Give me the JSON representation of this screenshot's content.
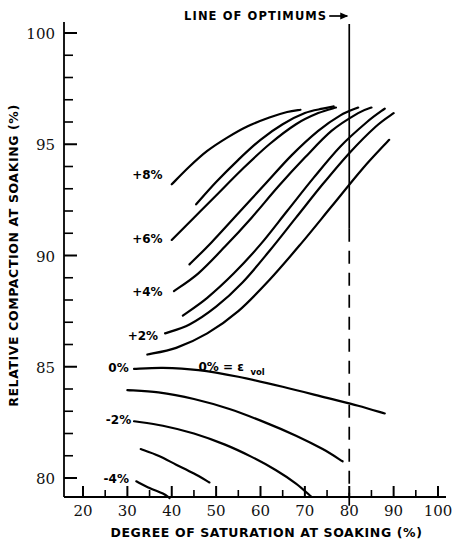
{
  "chart_data": {
    "type": "line",
    "title": "",
    "xlabel": "DEGREE OF SATURATION AT SOAKING (%)",
    "ylabel": "RELATIVE COMPACTION AT SOAKING (%)",
    "xlim": [
      18,
      102
    ],
    "ylim": [
      78.2,
      101
    ],
    "grid": false,
    "legend_position": "inline-curve-labels",
    "xticks": [
      20,
      30,
      40,
      50,
      60,
      70,
      80,
      90,
      100
    ],
    "xtick_labels": [
      "20",
      "30",
      "40",
      "50",
      "60",
      "70",
      "80",
      "90",
      "100"
    ],
    "x_minor_step": 5,
    "yticks": [
      80,
      85,
      90,
      95,
      100
    ],
    "ytick_labels": [
      "80",
      "85",
      "90",
      "95",
      "100"
    ],
    "y_minor_step": 1,
    "annotations": [
      {
        "name": "line-of-optimums",
        "text": "LINE OF OPTIMUMS",
        "x": 80,
        "arrow": "right"
      },
      {
        "name": "evol-definition",
        "text": "0% = ε",
        "subscript": "vol",
        "x": 46,
        "y": 84.9
      }
    ],
    "reference_line": {
      "name": "line-of-optimums",
      "x": 80,
      "style": "solid-then-dashed",
      "from_y": 78.6,
      "to_y": 101
    },
    "series": [
      {
        "name": "+8%",
        "label": "+8%",
        "label_x": 34.5,
        "label_y": 93.6,
        "points": [
          [
            40.0,
            93.2
          ],
          [
            44,
            94.0
          ],
          [
            48,
            94.7
          ],
          [
            52.5,
            95.3
          ],
          [
            57,
            95.8
          ],
          [
            62,
            96.2
          ],
          [
            66,
            96.45
          ],
          [
            69,
            96.55
          ]
        ]
      },
      {
        "name": "+7%",
        "label": "",
        "label_x": null,
        "label_y": null,
        "points": [
          [
            45.5,
            92.3
          ],
          [
            50,
            93.3
          ],
          [
            55,
            94.3
          ],
          [
            60,
            95.2
          ],
          [
            65,
            95.9
          ],
          [
            70,
            96.4
          ],
          [
            74,
            96.6
          ],
          [
            76.5,
            96.7
          ]
        ]
      },
      {
        "name": "+6%",
        "label": "+6%",
        "label_x": 34.5,
        "label_y": 90.75,
        "points": [
          [
            40.0,
            90.7
          ],
          [
            45,
            91.7
          ],
          [
            50,
            92.7
          ],
          [
            56,
            93.9
          ],
          [
            62,
            95.0
          ],
          [
            68,
            95.9
          ],
          [
            73,
            96.4
          ],
          [
            77,
            96.65
          ]
        ]
      },
      {
        "name": "+5%",
        "label": "",
        "label_x": null,
        "label_y": null,
        "points": [
          [
            44.0,
            89.6
          ],
          [
            49,
            90.6
          ],
          [
            55,
            91.9
          ],
          [
            61,
            93.2
          ],
          [
            67,
            94.5
          ],
          [
            73,
            95.6
          ],
          [
            78,
            96.3
          ],
          [
            82,
            96.65
          ]
        ]
      },
      {
        "name": "+4%",
        "label": "+4%",
        "label_x": 34.5,
        "label_y": 88.35,
        "points": [
          [
            40.5,
            88.4
          ],
          [
            46,
            89.2
          ],
          [
            52,
            90.4
          ],
          [
            58,
            91.7
          ],
          [
            64,
            93.1
          ],
          [
            70,
            94.4
          ],
          [
            76,
            95.6
          ],
          [
            82,
            96.4
          ],
          [
            85,
            96.65
          ]
        ]
      },
      {
        "name": "+3%",
        "label": "",
        "label_x": null,
        "label_y": null,
        "points": [
          [
            42.5,
            87.3
          ],
          [
            48,
            88.1
          ],
          [
            54,
            89.2
          ],
          [
            60,
            90.5
          ],
          [
            66,
            92.0
          ],
          [
            72,
            93.5
          ],
          [
            78,
            94.9
          ],
          [
            84,
            96.0
          ],
          [
            88,
            96.6
          ]
        ]
      },
      {
        "name": "+2%",
        "label": "+2%",
        "label_x": 33.5,
        "label_y": 86.4,
        "points": [
          [
            38.5,
            86.5
          ],
          [
            44,
            86.9
          ],
          [
            50,
            87.7
          ],
          [
            56,
            88.8
          ],
          [
            62,
            90.2
          ],
          [
            68,
            91.7
          ],
          [
            74,
            93.2
          ],
          [
            80,
            94.6
          ],
          [
            86,
            95.8
          ],
          [
            90,
            96.4
          ]
        ]
      },
      {
        "name": "+1%",
        "label": "",
        "label_x": null,
        "label_y": null,
        "points": [
          [
            34.5,
            85.55
          ],
          [
            41,
            85.85
          ],
          [
            48,
            86.5
          ],
          [
            55,
            87.5
          ],
          [
            62,
            88.9
          ],
          [
            69,
            90.5
          ],
          [
            76,
            92.2
          ],
          [
            83,
            93.9
          ],
          [
            89,
            95.2
          ]
        ]
      },
      {
        "name": "0%",
        "label": "0%",
        "label_x": 28.0,
        "label_y": 84.95,
        "points": [
          [
            31.5,
            84.9
          ],
          [
            38,
            84.95
          ],
          [
            46,
            84.85
          ],
          [
            55,
            84.55
          ],
          [
            65,
            84.1
          ],
          [
            75,
            83.6
          ],
          [
            82,
            83.25
          ],
          [
            88,
            82.9
          ]
        ]
      },
      {
        "name": "-1%",
        "label": "",
        "label_x": null,
        "label_y": null,
        "points": [
          [
            30.0,
            83.95
          ],
          [
            37,
            83.85
          ],
          [
            45,
            83.55
          ],
          [
            53,
            83.1
          ],
          [
            61,
            82.5
          ],
          [
            68,
            81.9
          ],
          [
            74,
            81.3
          ],
          [
            78.5,
            80.75
          ]
        ]
      },
      {
        "name": "-2%",
        "label": "-2%",
        "label_x": 28.0,
        "label_y": 82.6,
        "points": [
          [
            31.5,
            82.55
          ],
          [
            38,
            82.35
          ],
          [
            45,
            82.0
          ],
          [
            52,
            81.5
          ],
          [
            58,
            80.95
          ],
          [
            63.5,
            80.35
          ],
          [
            68,
            79.75
          ],
          [
            71.5,
            79.15
          ]
        ]
      },
      {
        "name": "-3%",
        "label": "",
        "label_x": null,
        "label_y": null,
        "points": [
          [
            33.0,
            81.3
          ],
          [
            37,
            81.0
          ],
          [
            41,
            80.6
          ],
          [
            45,
            80.2
          ],
          [
            48.5,
            79.8
          ]
        ]
      },
      {
        "name": "-4%",
        "label": "-4%",
        "label_x": 27.5,
        "label_y": 79.95,
        "points": [
          [
            32.0,
            79.85
          ],
          [
            35,
            79.55
          ],
          [
            38,
            79.3
          ],
          [
            39.5,
            79.1
          ]
        ]
      }
    ]
  }
}
